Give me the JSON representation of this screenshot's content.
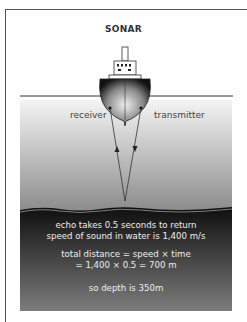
{
  "title": "SONAR",
  "labels": {
    "receiver": "receiver",
    "transmitter": "transmitter"
  },
  "explanation": {
    "line1": "echo takes 0.5 seconds to return",
    "line2": "speed of sound in water is 1,400 m/s",
    "line3": "total distance = speed × time",
    "line4": "= 1,400 × 0.5 = 700 m",
    "line5": "so depth is 350m"
  },
  "colors": {
    "water_top": "#f2f2f2",
    "water_bottom": "#8c8c8c",
    "seabed_top": "#111111",
    "seabed_bottom": "#7a7a7a",
    "line": "#333333"
  }
}
